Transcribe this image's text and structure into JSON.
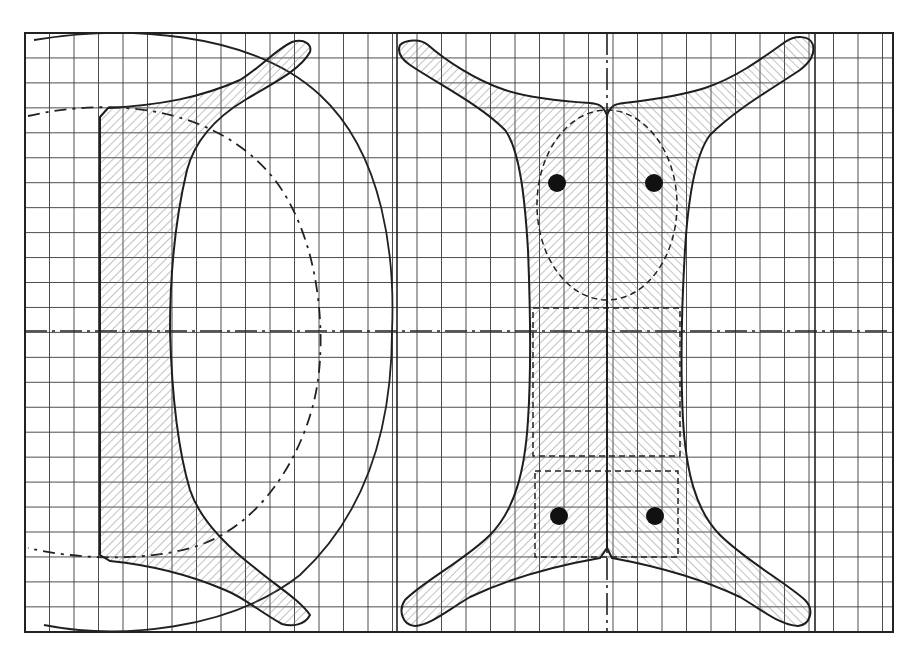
{
  "figure": {
    "title": "",
    "colors": {
      "line": "#1e1e1e",
      "grid": "#3a3a3a",
      "background": "#ffffff",
      "hole": "#111111"
    }
  },
  "grid": {
    "left": 25,
    "top": 33,
    "right": 893,
    "bottom": 632,
    "pitch_x": 24.5,
    "pitch_y": 24.95
  },
  "views": [
    {
      "name": "side-view",
      "features": [
        "hatched-profile",
        "large-arc-solid",
        "dash-dot-arc",
        "horizontal-center-axis",
        "vertical-reference-line"
      ]
    },
    {
      "name": "plan-view",
      "features": [
        "hatched-four-arm-outline",
        "vertical-center-axis",
        "horizontal-center-axis",
        "dashed-oval-upper",
        "dashed-rectangle-middle",
        "dashed-rectangle-lower",
        "four-holes"
      ]
    }
  ],
  "holes": [
    {
      "cx": 557,
      "cy": 183,
      "r": 9
    },
    {
      "cx": 654,
      "cy": 183,
      "r": 9
    },
    {
      "cx": 559,
      "cy": 516,
      "r": 9
    },
    {
      "cx": 655,
      "cy": 516,
      "r": 9
    }
  ]
}
